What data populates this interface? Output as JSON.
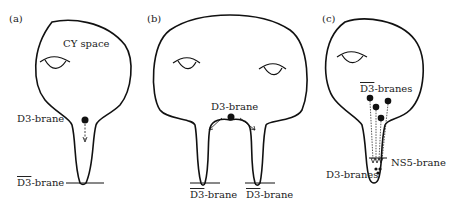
{
  "panels": [
    {
      "id": "a",
      "label": "(a)",
      "space_label": "CY space",
      "brane_label": "D3-brane",
      "anti_prefix": "D3",
      "anti_suffix": "-brane"
    },
    {
      "id": "b",
      "label": "(b)",
      "brane_label": "D3-brane",
      "anti_left_prefix": "D3",
      "anti_left_suffix": "-brane",
      "anti_right_prefix": "D3",
      "anti_right_suffix": "-brane"
    },
    {
      "id": "c",
      "label": "(c)",
      "anti_prefix": "D3",
      "anti_suffix": "-branes",
      "ns5_label": "NS5-brane",
      "d3s_label": "D3-branes"
    }
  ],
  "colors": {
    "stroke": "#111111",
    "text": "#222222",
    "background": "#ffffff"
  }
}
